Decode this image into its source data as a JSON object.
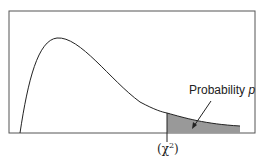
{
  "diagram": {
    "annotation_label": "Probability",
    "annotation_var": "p",
    "critical_value_label": "(χ²)",
    "critical_value_symbol": "χ",
    "critical_value_exponent": "2",
    "colors": {
      "frame": "#555555",
      "curve": "#222222",
      "shade": "#999999"
    }
  }
}
